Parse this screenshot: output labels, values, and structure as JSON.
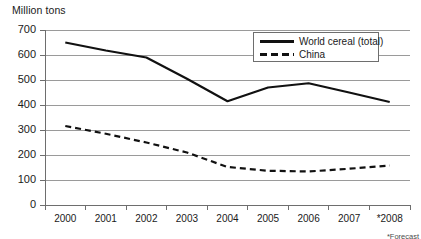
{
  "chart_data": {
    "type": "line",
    "title": "Million tons",
    "xlabel": "",
    "ylabel": "Million tons",
    "ylim": [
      0,
      700
    ],
    "ytick_step": 100,
    "yticks": [
      0,
      100,
      200,
      300,
      400,
      500,
      600,
      700
    ],
    "categories": [
      "2000",
      "2001",
      "2002",
      "2003",
      "2004",
      "2005",
      "2006",
      "2007",
      "*2008"
    ],
    "grid": "horizontal",
    "legend_position": "top-right",
    "footnote": "*Forecast",
    "series": [
      {
        "name": "World cereal (total)",
        "style": "solid",
        "color": "#111111",
        "values": [
          650,
          618,
          590,
          505,
          415,
          470,
          487,
          450,
          412
        ]
      },
      {
        "name": "China",
        "style": "dashed",
        "color": "#111111",
        "values": [
          316,
          285,
          250,
          210,
          152,
          137,
          134,
          145,
          158
        ]
      }
    ]
  },
  "colors": {
    "axis": "#6e6e6e",
    "grid": "#9a9a9a",
    "line": "#111111",
    "text": "#1a1a1a"
  }
}
